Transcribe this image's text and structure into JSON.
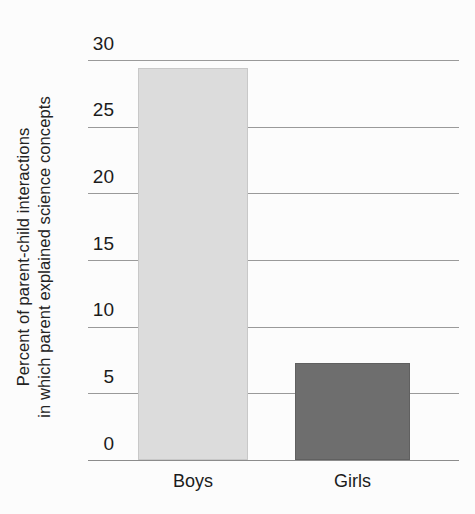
{
  "chart_data": {
    "type": "bar",
    "title": "",
    "subtitle": "",
    "xlabel": "",
    "ylabel_line1": "Percent of parent-child interactions",
    "ylabel_line2": "in which parent explained science concepts",
    "categories": [
      "Boys",
      "Girls"
    ],
    "values": [
      29.4,
      7.3
    ],
    "series": [
      {
        "name": "Percent of parent-child interactions in which parent explained science concepts",
        "values": [
          29.4,
          7.3
        ]
      }
    ],
    "ylim": [
      0,
      30
    ],
    "yticks": [
      0,
      5,
      10,
      15,
      20,
      25,
      30
    ],
    "ytick_labels": [
      "0",
      "5",
      "10",
      "15",
      "20",
      "25",
      "30"
    ],
    "grid": true,
    "legend": false,
    "legend_position": "none",
    "bar_colors": [
      "#dcdcdc",
      "#6e6e6e"
    ],
    "gridline_color": "#9a9a9a",
    "background_color": "#fcfcfc",
    "text_color": "#1b1b1b"
  },
  "axis": {
    "ticks": [
      {
        "label": "30",
        "value": 30
      },
      {
        "label": "25",
        "value": 25
      },
      {
        "label": "20",
        "value": 20
      },
      {
        "label": "15",
        "value": 15
      },
      {
        "label": "10",
        "value": 10
      },
      {
        "label": "5",
        "value": 5
      },
      {
        "label": "0",
        "value": 0
      }
    ]
  },
  "bars": [
    {
      "category": "Boys",
      "value": 29.4,
      "color": "#dcdcdc"
    },
    {
      "category": "Girls",
      "value": 7.3,
      "color": "#6e6e6e"
    }
  ]
}
